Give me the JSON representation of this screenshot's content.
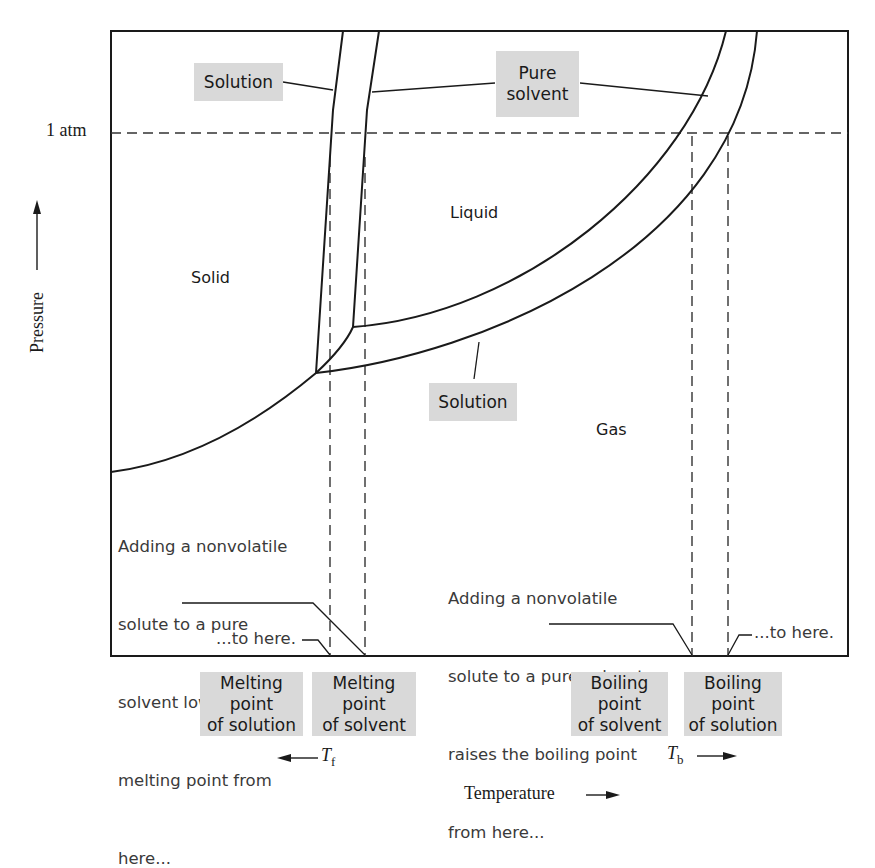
{
  "diagram": {
    "y_axis": {
      "label": "Pressure",
      "arrow": "up-arrow",
      "tick": "1 atm"
    },
    "x_axis": {
      "label": "Temperature",
      "arrow": "right-arrow"
    },
    "regions": {
      "solid": "Solid",
      "liquid": "Liquid",
      "gas": "Gas"
    },
    "callouts": {
      "solution_top": "Solution",
      "pure_solvent_top": "Pure\nsolvent",
      "pure_solvent_line1": "Pure",
      "pure_solvent_line2": "solvent",
      "solution_bottom": "Solution"
    },
    "notes": {
      "melting": {
        "line1": "Adding a nonvolatile",
        "line2": "solute to a pure",
        "line3": "solvent lowers the",
        "line4": "melting point from",
        "line5": "here...",
        "to_here": "...to here."
      },
      "boiling": {
        "line1": "Adding a nonvolatile",
        "line2": "solute to a pure solvent",
        "line3": "raises the boiling point",
        "line4": "from here...",
        "to_here": "...to here."
      }
    },
    "bottom_labels": [
      {
        "line1": "Melting point",
        "line2": "of solution"
      },
      {
        "line1": "Melting point",
        "line2": "of solvent"
      },
      {
        "line1": "Boiling point",
        "line2": "of solvent"
      },
      {
        "line1": "Boiling point",
        "line2": "of solution"
      }
    ],
    "delta_labels": {
      "tf_main": "T",
      "tf_sub": "f",
      "tf_arrow": "left-arrow",
      "tb_main": "T",
      "tb_sub": "b",
      "tb_arrow": "right-arrow"
    },
    "colors": {
      "line": "#1a1a1a",
      "label_box": "#d9d9d9",
      "note_text": "#3a3a3a"
    }
  }
}
